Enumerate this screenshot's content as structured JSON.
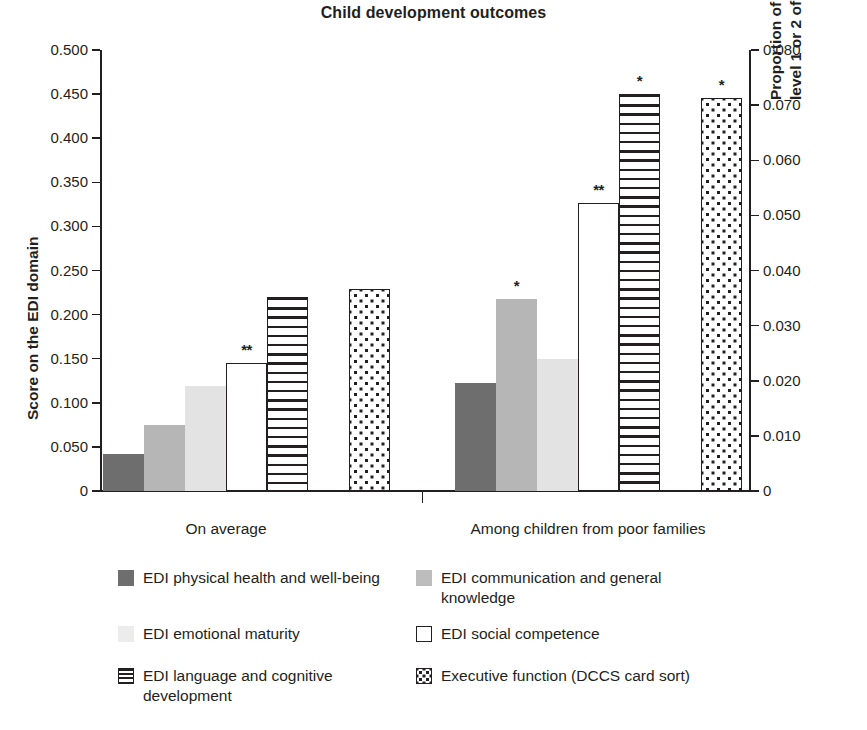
{
  "chart_data": {
    "type": "bar",
    "title": "Child development outcomes",
    "xlabel": "",
    "ylabel": "Score on the EDI domain",
    "y2label": "Proportion of children able to perform level 1 or 2 of card sorting task",
    "ylim": [
      0,
      0.5
    ],
    "y2lim": [
      0,
      0.08
    ],
    "grid": false,
    "legend_position": "bottom",
    "categories": [
      "On average",
      "Among children from poor families"
    ],
    "yticks": [
      "0",
      "0.050",
      "0.100",
      "0.150",
      "0.200",
      "0.250",
      "0.300",
      "0.350",
      "0.400",
      "0.450",
      "0.500"
    ],
    "y2ticks": [
      "0",
      "0.010",
      "0.020",
      "0.030",
      "0.040",
      "0.050",
      "0.060",
      "0.070",
      "0.080"
    ],
    "series": [
      {
        "name": "EDI physical health and well-being",
        "key": "physical",
        "pattern": "solid-dark",
        "axis": "left",
        "values": [
          0.042,
          0.123
        ],
        "significance": [
          "",
          ""
        ]
      },
      {
        "name": "EDI communication and general knowledge",
        "key": "communication",
        "pattern": "solid-med",
        "axis": "left",
        "values": [
          0.075,
          0.218
        ],
        "significance": [
          "",
          "*"
        ]
      },
      {
        "name": "EDI emotional maturity",
        "key": "emotional",
        "pattern": "solid-light",
        "axis": "left",
        "values": [
          0.119,
          0.15
        ],
        "significance": [
          "",
          ""
        ]
      },
      {
        "name": "EDI social competence",
        "key": "social",
        "pattern": "open",
        "axis": "left",
        "values": [
          0.145,
          0.327
        ],
        "significance": [
          "**",
          "**"
        ]
      },
      {
        "name": "EDI language and cognitive development",
        "key": "language",
        "pattern": "hstripe",
        "axis": "left",
        "values": [
          0.22,
          0.45
        ],
        "significance": [
          "",
          "*"
        ]
      },
      {
        "name": "Executive function (DCCS card sort)",
        "key": "executive",
        "pattern": "dots",
        "axis": "right",
        "values": [
          0.0366,
          0.0713
        ],
        "values_left_equivalent": [
          0.229,
          0.4457
        ],
        "significance": [
          "",
          "*"
        ]
      }
    ],
    "legend": [
      {
        "label": "EDI physical health and well-being",
        "pattern": "sw-dark"
      },
      {
        "label": "EDI communication and general knowledge",
        "pattern": "sw-med"
      },
      {
        "label": "EDI emotional maturity",
        "pattern": "sw-light"
      },
      {
        "label": "EDI social competence",
        "pattern": "sw-open"
      },
      {
        "label": "EDI language and cognitive development",
        "pattern": "sw-hstripe"
      },
      {
        "label": "Executive function (DCCS card sort)",
        "pattern": "sw-dots"
      }
    ],
    "colors": {
      "dark_gray": "#6e6e6e",
      "medium_gray": "#b6b6b6",
      "light_gray": "#e3e3e3",
      "ink": "#231f20",
      "background": "#ffffff"
    }
  }
}
